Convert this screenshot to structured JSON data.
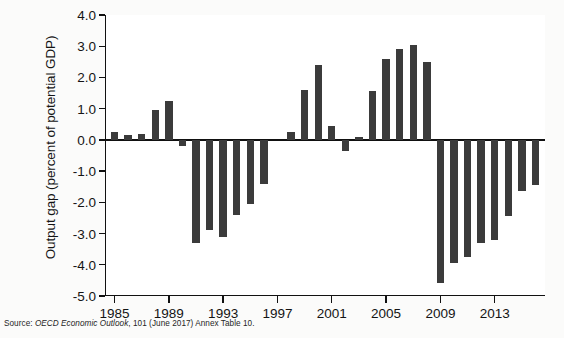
{
  "figure": {
    "background_color": "#fbfbfa",
    "plot_background_color": "#ffffff",
    "bar_color": "#3b3b3b",
    "axis_color": "#111111"
  },
  "source": {
    "prefix": "Source: ",
    "publication": "OECD Economic Outlook",
    "suffix": ", 101 (June 2017) Annex Table 10."
  },
  "chart_data": {
    "type": "bar",
    "title": "",
    "subtitle": "",
    "xlabel": "",
    "ylabel": "Output gap (percent of potential GDP)",
    "ylim": [
      -5.0,
      4.0
    ],
    "xlim": [
      1984.3,
      2016.7
    ],
    "grid": false,
    "legend": "none",
    "y_ticks": [
      4.0,
      3.0,
      2.0,
      1.0,
      0.0,
      -1.0,
      -2.0,
      -3.0,
      -4.0,
      -5.0
    ],
    "y_tick_labels": [
      "4.0",
      "3.0",
      "2.0",
      "1.0",
      "0.0",
      "-1.0",
      "-2.0",
      "-3.0",
      "-4.0",
      "-5.0"
    ],
    "x_ticks": [
      1985,
      1989,
      1993,
      1997,
      2001,
      2005,
      2009,
      2013
    ],
    "x_tick_labels": [
      "1985",
      "1989",
      "1993",
      "1997",
      "2001",
      "2005",
      "2009",
      "2013"
    ],
    "categories": [
      1985,
      1986,
      1987,
      1988,
      1989,
      1990,
      1991,
      1992,
      1993,
      1994,
      1995,
      1996,
      1997,
      1998,
      1999,
      2000,
      2001,
      2002,
      2003,
      2004,
      2005,
      2006,
      2007,
      2008,
      2009,
      2010,
      2011,
      2012,
      2013,
      2014,
      2015,
      2016
    ],
    "values": [
      0.25,
      0.15,
      0.2,
      0.95,
      1.25,
      -0.2,
      -3.3,
      -2.9,
      -3.1,
      -2.4,
      -2.05,
      -1.4,
      0.0,
      0.25,
      1.6,
      2.4,
      0.45,
      -0.35,
      0.1,
      1.55,
      2.6,
      2.9,
      3.05,
      2.5,
      -4.6,
      -3.95,
      -3.75,
      -3.3,
      -3.2,
      -2.45,
      -1.65,
      -1.45
    ],
    "series": [
      {
        "name": "Output gap",
        "values": [
          0.25,
          0.15,
          0.2,
          0.95,
          1.25,
          -0.2,
          -3.3,
          -2.9,
          -3.1,
          -2.4,
          -2.05,
          -1.4,
          0.0,
          0.25,
          1.6,
          2.4,
          0.45,
          -0.35,
          0.1,
          1.55,
          2.6,
          2.9,
          3.05,
          2.5,
          -4.6,
          -3.95,
          -3.75,
          -3.3,
          -3.2,
          -2.45,
          -1.65,
          -1.45
        ]
      }
    ]
  }
}
